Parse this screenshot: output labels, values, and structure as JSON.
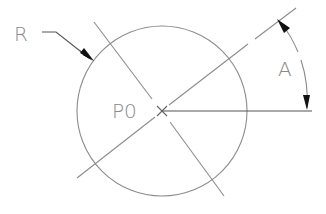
{
  "diagram": {
    "type": "cad-circle-dimension",
    "labels": {
      "radius": "R",
      "center": "P0",
      "angle": "A"
    },
    "colors": {
      "line": "#8c8c8c",
      "dark_line": "#555555",
      "arrow": "#111111",
      "text": "#8a8a8a",
      "background": "#ffffff"
    },
    "circle": {
      "cx": 162,
      "cy": 111,
      "r": 85
    },
    "center_marker": "x-cross",
    "angle_dimension": {
      "from": "horizontal",
      "to": "diagonal",
      "arrowheads": 2
    }
  }
}
